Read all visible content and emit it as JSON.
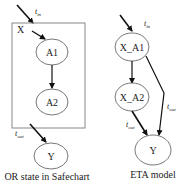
{
  "left": {
    "container_label": "X",
    "states": [
      "A1",
      "A2",
      "Y"
    ],
    "t_in": {
      "base": "t",
      "sub": "in"
    },
    "t_out": {
      "base": "t",
      "sub": "out"
    },
    "caption": "OR state in Safechart"
  },
  "right": {
    "states": [
      "X_A1",
      "X_A2",
      "Y"
    ],
    "t_in": {
      "base": "t",
      "sub": "in"
    },
    "t_out_a2": {
      "base": "t",
      "sub": "out"
    },
    "t_out_a1": {
      "base": "t",
      "sub": "out"
    },
    "caption": "ETA model"
  }
}
